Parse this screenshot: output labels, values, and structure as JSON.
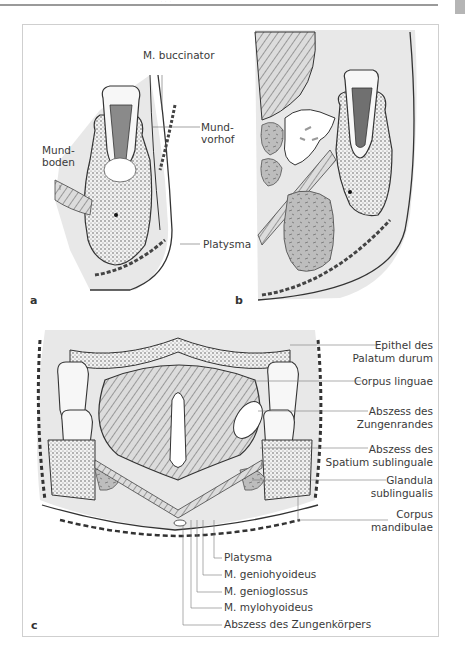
{
  "page": {
    "header_text": "...",
    "thumb_tab_color": "#b5b5b5"
  },
  "figure": {
    "panels": {
      "a": {
        "letter": "a"
      },
      "b": {
        "letter": "b"
      },
      "c": {
        "letter": "c"
      }
    },
    "panel_a_labels": {
      "buccinator": "M. buccinator",
      "mundvorhof_1": "Mund-",
      "mundvorhof_2": "vorhof",
      "mundboden_1": "Mund-",
      "mundboden_2": "boden",
      "platysma": "Platysma"
    },
    "panel_c_right_labels": [
      {
        "line1": "Epithel des",
        "line2": "Palatum durum"
      },
      {
        "line1": "Corpus linguae",
        "line2": ""
      },
      {
        "line1": "Abszess des",
        "line2": "Zungenrandes"
      },
      {
        "line1": "Abszess des",
        "line2": "Spatium sublinguale"
      },
      {
        "line1": "Glandula",
        "line2": "sublingualis"
      },
      {
        "line1": "Corpus",
        "line2": "mandibulae"
      }
    ],
    "panel_c_bottom_labels": [
      "Platysma",
      "M. geniohyoideus",
      "M. genioglossus",
      "M. mylohyoideus",
      "Abszess des Zungenkörpers"
    ],
    "colors": {
      "tissue_gray": "#e6e6e6",
      "line": "#3c3c3c",
      "abscess_fill": "#ffffff",
      "gland_fill": "#a8a8a8",
      "label_text": "#3a3a3a"
    }
  }
}
